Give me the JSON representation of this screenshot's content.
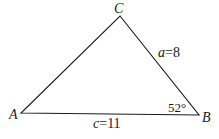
{
  "diagram": {
    "type": "triangle",
    "vertices": {
      "A": {
        "label": "A",
        "x": 21,
        "y": 113
      },
      "B": {
        "label": "B",
        "x": 199,
        "y": 115
      },
      "C": {
        "label": "C",
        "x": 120,
        "y": 16
      }
    },
    "sides": {
      "a": {
        "var": "a",
        "eq": "=",
        "value": "8",
        "between": [
          "B",
          "C"
        ]
      },
      "c": {
        "var": "c",
        "eq": "=",
        "value": "11",
        "between": [
          "A",
          "B"
        ]
      }
    },
    "angles": {
      "B": {
        "label": "52°",
        "value": 52,
        "unit": "degrees"
      }
    },
    "stroke_color": "#1a1a1a",
    "background": "#ffffff"
  }
}
